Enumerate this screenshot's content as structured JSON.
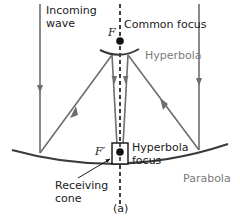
{
  "diagram": {
    "caption": "(a)",
    "labels": {
      "incoming_wave_line1": "Incoming",
      "incoming_wave_line2": "wave",
      "common_focus": "Common focus",
      "focus_f": "F",
      "hyperbola": "Hyperbola",
      "hyperbola_focus_line1": "Hyperbola",
      "hyperbola_focus_line2": "focus",
      "focus_f_prime": "F′",
      "receiving_cone_line1": "Receiving",
      "receiving_cone_line2": "cone",
      "parabola": "Parabola"
    },
    "colors": {
      "ray": "#6e6e6e",
      "curve": "#3a3a3a",
      "axis": "#111111",
      "text_dark": "#1a1a1a",
      "text_gray": "#7a7a7a"
    }
  }
}
